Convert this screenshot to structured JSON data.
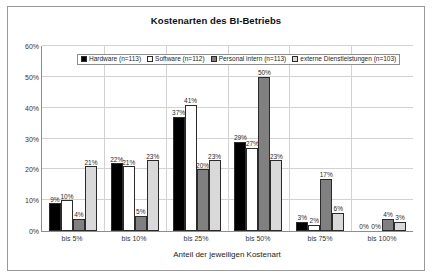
{
  "chart_data": {
    "type": "bar",
    "title": "Kostenarten des BI-Betriebs",
    "xlabel": "Anteil der jeweiligen Kostenart",
    "ylabel": "",
    "ylim": [
      0,
      60
    ],
    "yticks": [
      "0%",
      "10%",
      "20%",
      "30%",
      "40%",
      "50%",
      "60%"
    ],
    "ytick_values": [
      0,
      10,
      20,
      30,
      40,
      50,
      60
    ],
    "grid": true,
    "legend_position": "top-center",
    "categories": [
      "bis 5%",
      "bis 10%",
      "bis 25%",
      "bis 50%",
      "bis 75%",
      "bis 100%"
    ],
    "series": [
      {
        "name": "Hardware (n=113)",
        "color": "#000000",
        "values": [
          9,
          22,
          37,
          29,
          3,
          0
        ],
        "labels": [
          "9%",
          "22%",
          "37%",
          "29%",
          "3%",
          "0%"
        ]
      },
      {
        "name": "Software (n=112)",
        "color": "#ffffff",
        "values": [
          10,
          21,
          41,
          27,
          2,
          0
        ],
        "labels": [
          "10%",
          "21%",
          "41%",
          "27%",
          "2%",
          "0%"
        ]
      },
      {
        "name": "Personal intern (n=113)",
        "color": "#808080",
        "values": [
          4,
          5,
          20,
          50,
          17,
          4
        ],
        "labels": [
          "4%",
          "5%",
          "20%",
          "50%",
          "17%",
          "4%"
        ]
      },
      {
        "name": "externe Dienstleistungen (n=103)",
        "color": "#d9d9d9",
        "values": [
          21,
          23,
          23,
          23,
          6,
          3
        ],
        "labels": [
          "21%",
          "23%",
          "23%",
          "23%",
          "6%",
          "3%"
        ]
      }
    ]
  }
}
